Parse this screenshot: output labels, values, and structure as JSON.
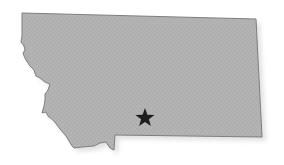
{
  "map": {
    "region": "Montana",
    "region_shape": "state-outline",
    "fill_color": "#b3b3b3",
    "stroke_color": "#7f7f7f",
    "shadow_color": "#d8d8d8",
    "background_color": "#ffffff",
    "marker": {
      "icon": "star-icon",
      "color": "#1e1e1e",
      "x": 145,
      "y": 118
    }
  }
}
